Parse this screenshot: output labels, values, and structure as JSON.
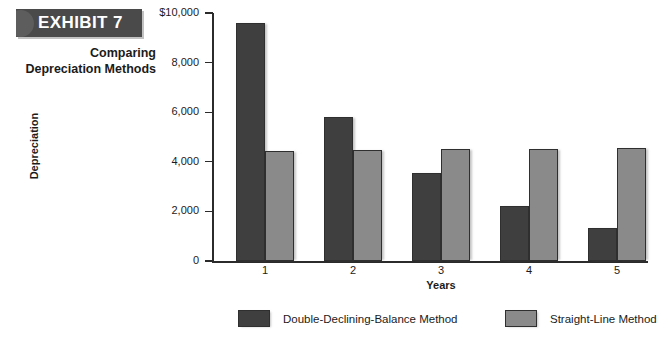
{
  "exhibit": {
    "banner_label": "EXHIBIT 7",
    "caption_line1": "Comparing",
    "caption_line2": "Depreciation Methods",
    "banner_color": "#4a4a4a"
  },
  "chart_data": {
    "type": "bar",
    "title": "Comparing Depreciation Methods",
    "xlabel": "Years",
    "ylabel": "Depreciation",
    "categories": [
      "1",
      "2",
      "3",
      "4",
      "5"
    ],
    "series": [
      {
        "name": "Double-Declining-Balance Method",
        "color": "#3f3f3f",
        "values": [
          9600,
          5800,
          3550,
          2200,
          1330
        ]
      },
      {
        "name": "Straight-Line Method",
        "color": "#8a8a8a",
        "values": [
          4450,
          4480,
          4500,
          4520,
          4550
        ]
      }
    ],
    "ylim": [
      0,
      10000
    ],
    "yticks": [
      0,
      2000,
      4000,
      6000,
      8000,
      10000
    ],
    "ytick_labels": [
      "0",
      "2,000",
      "4,000",
      "6,000",
      "8,000",
      "$10,000"
    ],
    "grid": false,
    "legend_position": "bottom"
  }
}
